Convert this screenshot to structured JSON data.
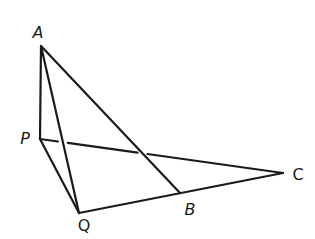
{
  "diagram": {
    "type": "geometry-figure",
    "points": [
      {
        "id": "A",
        "label": "A",
        "italic": true
      },
      {
        "id": "P",
        "label": "P",
        "italic": true
      },
      {
        "id": "Q",
        "label": "Q",
        "italic": false
      },
      {
        "id": "B",
        "label": "B",
        "italic": true
      },
      {
        "id": "C",
        "label": "C",
        "italic": false
      }
    ],
    "segments": [
      {
        "from": "A",
        "to": "P",
        "style": "solid"
      },
      {
        "from": "A",
        "to": "Q",
        "style": "solid"
      },
      {
        "from": "A",
        "to": "B",
        "style": "solid"
      },
      {
        "from": "P",
        "to": "Q",
        "style": "solid"
      },
      {
        "from": "Q",
        "to": "C",
        "style": "solid",
        "passes_through": "B"
      },
      {
        "from": "P",
        "to": "C",
        "style": "hidden-crossings",
        "broken_at": [
          "AQ",
          "AB"
        ]
      }
    ],
    "line_color": "#1a1a1a",
    "background": "#ffffff"
  }
}
